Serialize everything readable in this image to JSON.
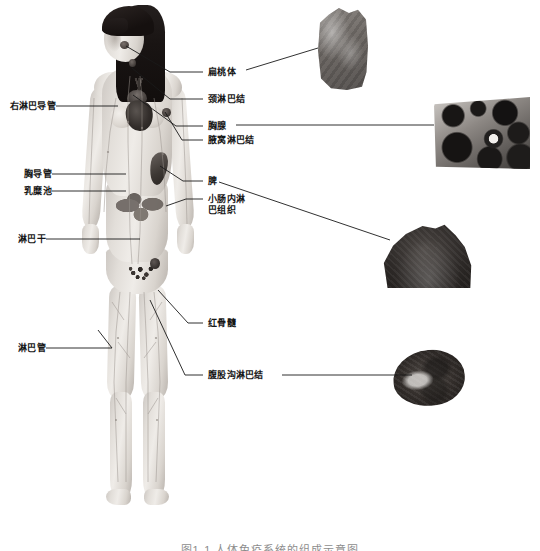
{
  "figure": {
    "caption": "图1-1 人体免疫系统的组成示意图"
  },
  "labels_left": [
    {
      "id": "right-lymphatic-duct",
      "text": "右淋巴导管"
    },
    {
      "id": "thoracic-duct",
      "text": "胸导管"
    },
    {
      "id": "cisterna-chyli",
      "text": "乳糜池"
    },
    {
      "id": "lymphatic-trunk",
      "text": "淋巴干"
    },
    {
      "id": "lymphatic-vessel",
      "text": "淋巴管"
    }
  ],
  "labels_right": [
    {
      "id": "tonsil",
      "text": "扁桃体"
    },
    {
      "id": "cervical-node",
      "text": "颈淋巴结"
    },
    {
      "id": "thymus",
      "text": "胸腺"
    },
    {
      "id": "axillary-node",
      "text": "腋窝淋巴结"
    },
    {
      "id": "spleen",
      "text": "脾"
    },
    {
      "id": "gut-lymphoid-l1",
      "text": "小肠内淋"
    },
    {
      "id": "gut-lymphoid-l2",
      "text": "巴组织"
    },
    {
      "id": "red-bone-marrow",
      "text": "红骨髓"
    },
    {
      "id": "inguinal-node",
      "text": "腹股沟淋巴结"
    }
  ],
  "insets": [
    {
      "id": "tonsil-histology",
      "for": "扁桃体"
    },
    {
      "id": "thymus-histology",
      "for": "胸腺"
    },
    {
      "id": "spleen-histology",
      "for": "脾"
    },
    {
      "id": "lymph-node-histology",
      "for": "腹股沟淋巴结"
    }
  ],
  "colors": {
    "background": "#ffffff",
    "label_text": "#161616",
    "leader_line": "#1a1a1a"
  }
}
